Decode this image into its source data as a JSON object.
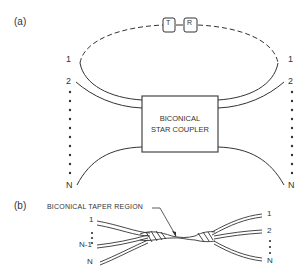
{
  "figure": {
    "panel_a": {
      "label": "(a)",
      "coupler_line1": "BICONICAL",
      "coupler_line2": "STAR COUPLER",
      "transmitter": "T",
      "receiver": "R",
      "left_ports": {
        "first": "1",
        "second": "2",
        "last": "N"
      },
      "right_ports": {
        "first": "1",
        "second": "2",
        "last": "N"
      }
    },
    "panel_b": {
      "label": "(b)",
      "callout": "BICONICAL TAPER REGION",
      "left_ports": {
        "first": "1",
        "penultimate": "N-1",
        "last": "N"
      },
      "right_ports": {
        "first": "1",
        "second": "2",
        "last": "N"
      }
    }
  },
  "colors": {
    "ink": "#333333",
    "background": "#ffffff"
  }
}
